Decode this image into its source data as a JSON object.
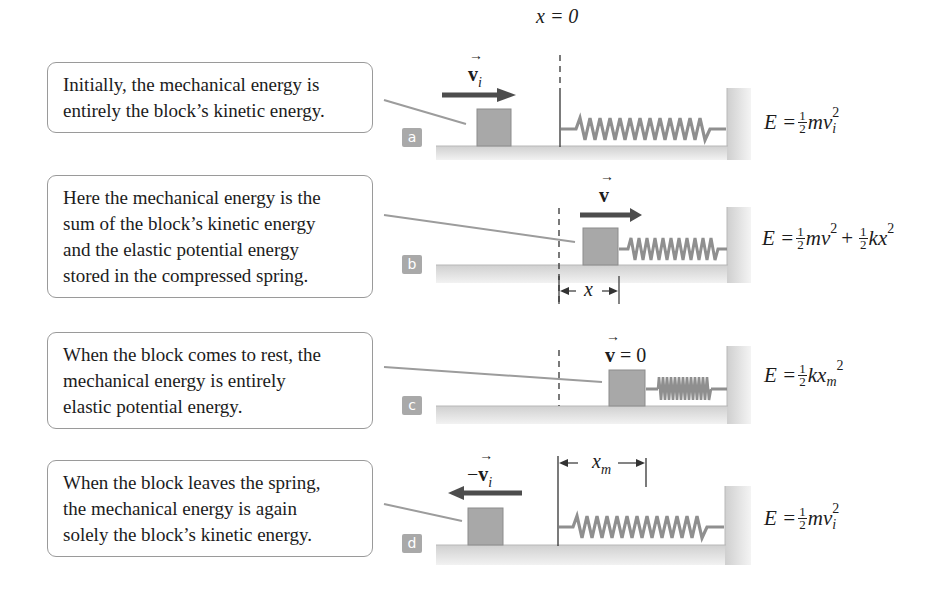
{
  "figure": {
    "origin_label": "x = 0",
    "panels": [
      {
        "id": "a",
        "badge": "a",
        "callout_lines": [
          "Initially, the mechanical energy is",
          "entirely the block’s kinetic energy."
        ],
        "velocity_label": {
          "prefix": "",
          "symbol": "v",
          "subscript": "i",
          "suffix": ""
        },
        "velocity_direction": "right",
        "spring_state": "relaxed",
        "equation": {
          "lhs": "E =",
          "coef": {
            "num": "1",
            "den": "2"
          },
          "terms": "mv",
          "subscript": "i",
          "superscript": "2"
        }
      },
      {
        "id": "b",
        "badge": "b",
        "callout_lines": [
          "Here the mechanical energy is the",
          "sum of the block’s kinetic energy",
          "and the elastic potential energy",
          "stored in the compressed spring."
        ],
        "velocity_label": {
          "prefix": "",
          "symbol": "v",
          "subscript": "",
          "suffix": ""
        },
        "velocity_direction": "right",
        "spring_state": "partially compressed",
        "dimension_label": "x",
        "equation": {
          "lhs": "E =",
          "coef1": {
            "num": "1",
            "den": "2"
          },
          "term1": "mv",
          "sup1": "2",
          "plus": "+",
          "coef2": {
            "num": "1",
            "den": "2"
          },
          "term2": "kx",
          "sup2": "2"
        }
      },
      {
        "id": "c",
        "badge": "c",
        "callout_lines": [
          "When the block comes to rest, the",
          "mechanical energy is entirely",
          "elastic potential energy."
        ],
        "velocity_label": {
          "prefix": "",
          "symbol": "v",
          "subscript": "",
          "suffix": " = 0"
        },
        "velocity_direction": "none",
        "spring_state": "fully compressed",
        "equation": {
          "lhs": "E =",
          "coef": {
            "num": "1",
            "den": "2"
          },
          "terms": "kx",
          "subscript": "m",
          "superscript": "2"
        }
      },
      {
        "id": "d",
        "badge": "d",
        "callout_lines": [
          "When the block leaves the spring,",
          "the mechanical energy is again",
          "solely the block’s kinetic energy."
        ],
        "velocity_label": {
          "prefix": "−",
          "symbol": "v",
          "subscript": "i",
          "suffix": ""
        },
        "velocity_direction": "left",
        "spring_state": "relaxed",
        "dimension_label": "x",
        "dimension_subscript": "m",
        "equation": {
          "lhs": "E =",
          "coef": {
            "num": "1",
            "den": "2"
          },
          "terms": "mv",
          "subscript": "i",
          "superscript": "2"
        }
      }
    ],
    "colors": {
      "callout_border": "#9a9a9a",
      "badge_bg": "#a9a9a9",
      "floor": "#d4d4d4",
      "block": "#a8a8a8",
      "arrow": "#4d4d4d",
      "spring": "#8f8f8f",
      "leader_line": "#9c9c9c"
    }
  }
}
